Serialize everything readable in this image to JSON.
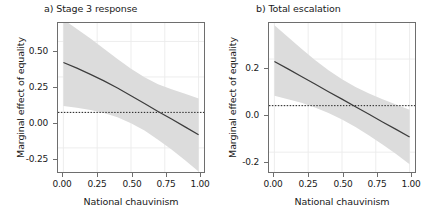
{
  "figure": {
    "axis_label_x": "National chauvinism",
    "axis_label_y": "Marginal effect of equality",
    "band_color": "#dcdcdc",
    "line_color": "#3c3c3c",
    "zero_line_color": "#1a1a1a",
    "grid_color": "#ebebeb",
    "panel_border_color": "#6e6e6e",
    "background": "#ffffff"
  },
  "chart_data": [
    {
      "type": "line",
      "panel": "a",
      "title": "a) Stage 3 response",
      "xlabel": "National chauvinism",
      "ylabel": "Marginal effect of equality",
      "xlim": [
        -0.04,
        1.04
      ],
      "ylim": [
        -0.42,
        0.63
      ],
      "xticks": [
        0.0,
        0.25,
        0.5,
        0.75,
        1.0
      ],
      "xticklabels": [
        "0.00",
        "0.25",
        "0.50",
        "0.75",
        "1.00"
      ],
      "yticks": [
        0.5,
        0.25,
        0.0,
        -0.25
      ],
      "yticklabels": [
        "0.50",
        "0.25",
        "0.00",
        "-0.25"
      ],
      "grid": true,
      "legend": "none",
      "zero_reference_line": 0.0,
      "x": [
        0.0,
        0.1,
        0.2,
        0.3,
        0.4,
        0.5,
        0.6,
        0.7,
        0.8,
        0.9,
        1.0
      ],
      "estimate": [
        0.352,
        0.312,
        0.268,
        0.222,
        0.172,
        0.118,
        0.062,
        0.007,
        -0.046,
        -0.102,
        -0.158
      ],
      "ci_lower": [
        0.045,
        0.033,
        0.017,
        -0.005,
        -0.035,
        -0.077,
        -0.128,
        -0.192,
        -0.262,
        -0.338,
        -0.416
      ],
      "ci_upper": [
        0.655,
        0.588,
        0.52,
        0.449,
        0.377,
        0.307,
        0.247,
        0.199,
        0.164,
        0.132,
        0.098
      ],
      "crossing_point": 0.615
    },
    {
      "type": "line",
      "panel": "b",
      "title": "b) Total escalation",
      "xlabel": "National chauvinism",
      "ylabel": "Marginal effect of equality",
      "xlim": [
        -0.04,
        1.04
      ],
      "ylim": [
        -0.285,
        0.355
      ],
      "xticks": [
        0.0,
        0.25,
        0.5,
        0.75,
        1.0
      ],
      "xticklabels": [
        "0.00",
        "0.25",
        "0.50",
        "0.75",
        "1.00"
      ],
      "yticks": [
        0.2,
        0.0,
        -0.2
      ],
      "yticklabels": [
        "0.2",
        "0.0",
        "-0.2"
      ],
      "grid": true,
      "legend": "none",
      "zero_reference_line": 0.0,
      "x": [
        0.0,
        0.1,
        0.2,
        0.3,
        0.4,
        0.5,
        0.6,
        0.7,
        0.8,
        0.9,
        1.0
      ],
      "estimate": [
        0.19,
        0.158,
        0.125,
        0.093,
        0.06,
        0.028,
        -0.005,
        -0.037,
        -0.07,
        -0.102,
        -0.135
      ],
      "ci_lower": [
        0.042,
        0.028,
        0.012,
        -0.008,
        -0.032,
        -0.06,
        -0.092,
        -0.128,
        -0.167,
        -0.208,
        -0.252
      ],
      "ci_upper": [
        0.345,
        0.295,
        0.244,
        0.196,
        0.152,
        0.113,
        0.08,
        0.052,
        0.028,
        0.005,
        -0.018
      ],
      "crossing_point": 0.585
    }
  ]
}
